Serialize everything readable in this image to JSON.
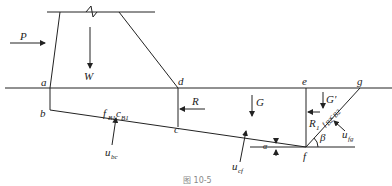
{
  "figure": {
    "caption": "图 10-5",
    "points": {
      "a": "a",
      "b": "b",
      "c": "c",
      "d": "d",
      "e": "e",
      "f": "f",
      "g": "g"
    },
    "forces": {
      "P": "P",
      "W": "W",
      "R": "R",
      "G": "G",
      "G_prime": "G'",
      "R1": "R",
      "R1_sub": "1",
      "u_bc": "u",
      "u_bc_sub": "bc",
      "u_cf": "u",
      "u_cf_sub": "cf",
      "u_fg": "u",
      "u_fg_sub": "fg"
    },
    "params": {
      "f_B1": "f",
      "f_B1_sub": "B1",
      "c_B1": "c",
      "c_B1_sub": "B1",
      "f_B2c_B2": "f",
      "f_B2c_B2_sub": "B2",
      "c_B2": "c",
      "c_B2_sub": "B2"
    },
    "angles": {
      "alpha": "α",
      "beta": "β"
    }
  }
}
